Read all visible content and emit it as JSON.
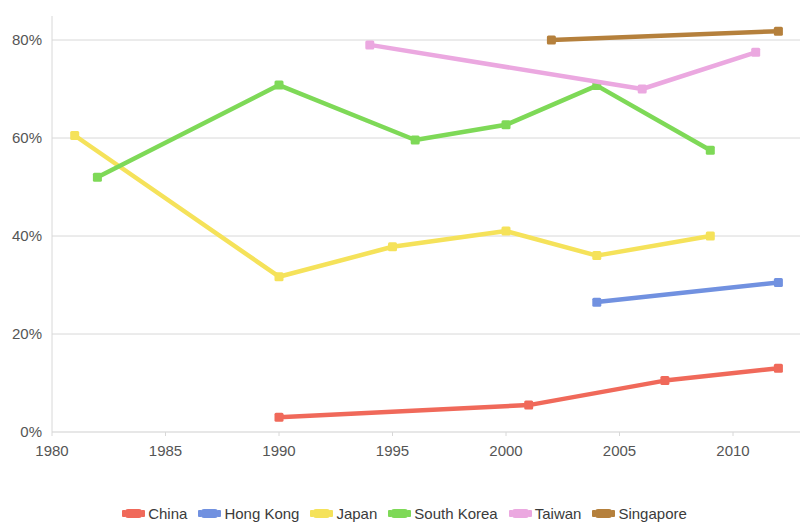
{
  "chart_data": {
    "type": "line",
    "title": "",
    "xlabel": "",
    "ylabel": "",
    "xlim": [
      1980,
      2013.5
    ],
    "ylim": [
      0,
      87
    ],
    "grid": true,
    "legend_position": "bottom",
    "y_ticks": [
      "0%",
      "20%",
      "40%",
      "60%",
      "80%"
    ],
    "y_tick_values": [
      0,
      20,
      40,
      60,
      80
    ],
    "x_ticks": [
      "1980",
      "1985",
      "1990",
      "1995",
      "2000",
      "2005",
      "2010"
    ],
    "x_tick_values": [
      1980,
      1985,
      1990,
      1995,
      2000,
      2005,
      2010
    ],
    "series": [
      {
        "name": "China",
        "color": "#f0695a",
        "x": [
          1990,
          2001,
          2007,
          2012
        ],
        "values": [
          3.0,
          5.5,
          10.5,
          13.0
        ]
      },
      {
        "name": "Hong Kong",
        "color": "#7191e0",
        "x": [
          2004,
          2012
        ],
        "values": [
          26.5,
          30.5
        ]
      },
      {
        "name": "Japan",
        "color": "#f5e25a",
        "x": [
          1981,
          1990,
          1995,
          2000,
          2004,
          2009
        ],
        "values": [
          60.5,
          31.7,
          37.8,
          41.0,
          36.0,
          40.0
        ]
      },
      {
        "name": "South Korea",
        "color": "#7ed957",
        "x": [
          1982,
          1990,
          1996,
          2000,
          2004,
          2009
        ],
        "values": [
          52.0,
          70.8,
          59.6,
          62.7,
          70.7,
          57.5
        ]
      },
      {
        "name": "Taiwan",
        "color": "#eba8e0",
        "x": [
          1994,
          2006,
          2011
        ],
        "values": [
          79.0,
          70.0,
          77.5
        ]
      },
      {
        "name": "Singapore",
        "color": "#b5803c",
        "x": [
          2002,
          2012
        ],
        "values": [
          80.0,
          81.8
        ]
      }
    ]
  },
  "legend": {
    "items": [
      {
        "label": "China",
        "color": "#f0695a"
      },
      {
        "label": "Hong Kong",
        "color": "#7191e0"
      },
      {
        "label": "Japan",
        "color": "#f5e25a"
      },
      {
        "label": "South Korea",
        "color": "#7ed957"
      },
      {
        "label": "Taiwan",
        "color": "#eba8e0"
      },
      {
        "label": "Singapore",
        "color": "#b5803c"
      }
    ]
  }
}
